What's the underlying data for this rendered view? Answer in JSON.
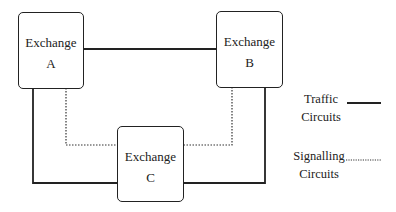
{
  "diagram": {
    "type": "network-topology",
    "nodes": [
      {
        "id": "A",
        "label_line1": "Exchange",
        "label_line2": "A"
      },
      {
        "id": "B",
        "label_line1": "Exchange",
        "label_line2": "B"
      },
      {
        "id": "C",
        "label_line1": "Exchange",
        "label_line2": "C"
      }
    ],
    "edges": [
      {
        "from": "A",
        "to": "B",
        "type": "traffic"
      },
      {
        "from": "A",
        "to": "C",
        "type": "traffic"
      },
      {
        "from": "B",
        "to": "C",
        "type": "traffic"
      },
      {
        "from": "A",
        "to": "C",
        "type": "signalling"
      },
      {
        "from": "B",
        "to": "C",
        "type": "signalling"
      }
    ],
    "legend": [
      {
        "line1": "Traffic",
        "line2": "Circuits",
        "style": "solid"
      },
      {
        "line1": "Signalling",
        "line2": "Circuits",
        "style": "dotted"
      }
    ]
  },
  "colors": {
    "line": "#222222",
    "background": "#ffffff"
  }
}
